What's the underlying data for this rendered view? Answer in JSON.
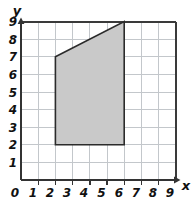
{
  "figure": {
    "caption": "Coordinate grid with shaded quadrilateral",
    "background_color": "#ffffff"
  },
  "axes": {
    "x_axis_label": "x",
    "y_axis_label": "y",
    "origin_label": "0",
    "x_tick_labels": [
      "1",
      "2",
      "3",
      "4",
      "5",
      "6",
      "7",
      "8",
      "9"
    ],
    "y_tick_labels": [
      "1",
      "2",
      "3",
      "4",
      "5",
      "6",
      "7",
      "8",
      "9"
    ],
    "axis_color": "#333333",
    "grid_color": "#c0c4c8",
    "grid_border_color": "#3a3a3a"
  },
  "chart_data": {
    "type": "scatter",
    "title": "",
    "xlabel": "x",
    "ylabel": "y",
    "xlim": [
      0,
      9.6
    ],
    "ylim": [
      0,
      9.6
    ],
    "x_ticks": [
      0,
      1,
      2,
      3,
      4,
      5,
      6,
      7,
      8,
      9
    ],
    "y_ticks": [
      0,
      1,
      2,
      3,
      4,
      5,
      6,
      7,
      8,
      9
    ],
    "grid": true,
    "legend": "none",
    "shapes": [
      {
        "name": "shaded-quadrilateral",
        "kind": "polygon",
        "vertices": [
          [
            2,
            7
          ],
          [
            6,
            9
          ],
          [
            6,
            2
          ],
          [
            2,
            2
          ]
        ],
        "fill": "#c9c9c9",
        "stroke": "#2b2b2b",
        "stroke_width": 1.6
      }
    ]
  }
}
